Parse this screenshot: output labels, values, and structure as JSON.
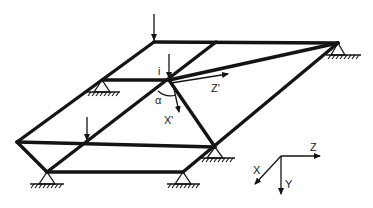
{
  "diagram": {
    "type": "grillage structure / skew grid of beams",
    "colors": {
      "ink": "#141414",
      "background": "#ffffff"
    },
    "labels": {
      "node_i": "i",
      "angle": "α",
      "local_z": "Z'",
      "local_x": "X'",
      "global_x": "X",
      "global_y": "Y",
      "global_z": "Z"
    },
    "nodes": {
      "A": [
        154,
        42
      ],
      "B": [
        338,
        43
      ],
      "C": [
        17,
        142
      ],
      "D": [
        47,
        172
      ],
      "S1": [
        102,
        80
      ],
      "i": [
        169,
        80
      ],
      "T": [
        216,
        42
      ],
      "E": [
        215,
        147
      ],
      "F": [
        183,
        172
      ],
      "G": [
        87,
        142
      ]
    },
    "supports": [
      "B",
      "S1",
      "D",
      "E",
      "F"
    ],
    "loads": [
      "A",
      "i",
      "G"
    ]
  }
}
